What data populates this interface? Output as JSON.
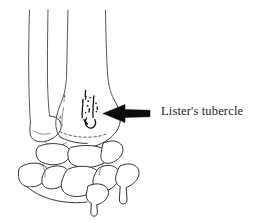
{
  "figure": {
    "type": "anatomical-line-drawing",
    "background_color": "#ffffff",
    "line_color": "#2f2f2f",
    "arrow_color": "#0b0b0b",
    "annotations": [
      {
        "id": "listers-tubercle",
        "label": "Lister's tubercle",
        "arrow": {
          "direction": "left",
          "tail_x": 150,
          "tail_y": 113,
          "tip_x": 103,
          "tip_y": 113
        },
        "label_x": 161,
        "label_y": 104
      }
    ],
    "structures": [
      {
        "name": "ulna-shaft",
        "label": "Ulna"
      },
      {
        "name": "radius-shaft",
        "label": "Radius"
      },
      {
        "name": "ulnar-head",
        "label": "Ulnar head"
      },
      {
        "name": "radial-styloid",
        "label": "Radial styloid process"
      },
      {
        "name": "listers-tubercle-detail",
        "label": "Lister's tubercle"
      },
      {
        "name": "carpal-bones-proximal-row",
        "label": "Proximal carpal row"
      },
      {
        "name": "carpal-bones-distal-row",
        "label": "Distal carpal row"
      }
    ]
  }
}
